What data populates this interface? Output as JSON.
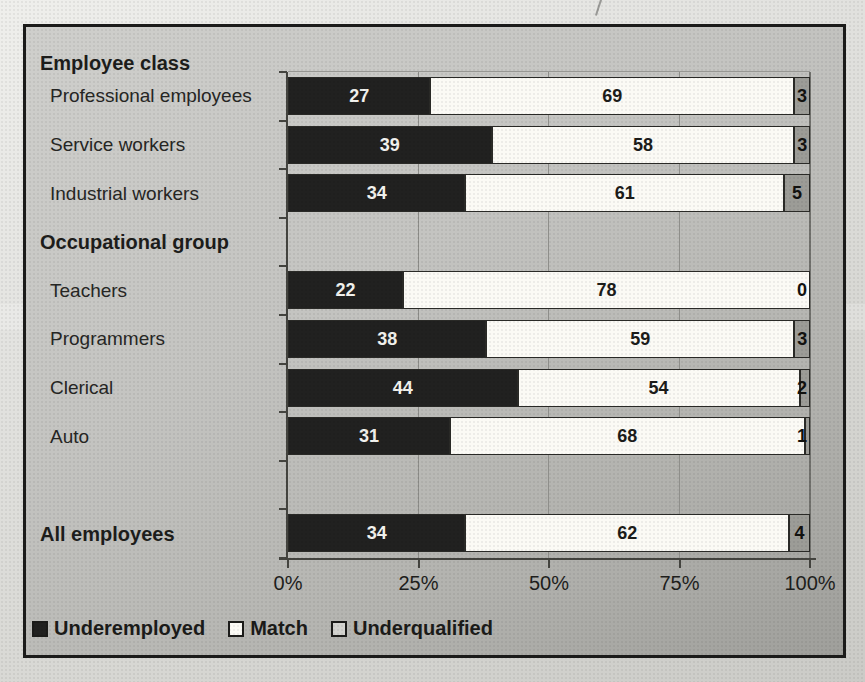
{
  "chart_data": {
    "type": "bar",
    "orientation": "horizontal",
    "stacked": true,
    "series": [
      "Underemployed",
      "Match",
      "Underqualified"
    ],
    "colors": [
      "#212120",
      "#fbfaf5",
      "#9c9c97"
    ],
    "value_label_colors": [
      "#f2f2ee",
      "#1c1c1a",
      "#121210"
    ],
    "x_axis": {
      "ticks": [
        "0%",
        "25%",
        "50%",
        "75%",
        "100%"
      ],
      "min": 0,
      "max": 100,
      "grid": true
    },
    "rows": [
      {
        "label": "Employee class",
        "style": "header",
        "values": null
      },
      {
        "label": "Professional employees",
        "values": [
          27,
          69,
          3
        ]
      },
      {
        "label": "Service workers",
        "values": [
          39,
          58,
          3
        ]
      },
      {
        "label": "Industrial workers",
        "values": [
          34,
          61,
          5
        ]
      },
      {
        "label": "Occupational group",
        "style": "header",
        "values": null
      },
      {
        "label": "Teachers",
        "values": [
          22,
          78,
          0
        ]
      },
      {
        "label": "Programmers",
        "values": [
          38,
          59,
          3
        ]
      },
      {
        "label": "Clerical",
        "values": [
          44,
          54,
          2
        ]
      },
      {
        "label": "Auto",
        "values": [
          31,
          68,
          1
        ]
      },
      {
        "label": "",
        "values": null
      },
      {
        "label": "All employees",
        "style": "header",
        "values": [
          34,
          62,
          4
        ]
      }
    ],
    "legend": [
      {
        "label": "Underemployed",
        "swatch": "#212120"
      },
      {
        "label": "Match",
        "swatch": "#fbfaf5"
      },
      {
        "label": "Underqualified",
        "swatch": "#d3d3cf"
      }
    ],
    "legend_position": "bottom-left"
  }
}
